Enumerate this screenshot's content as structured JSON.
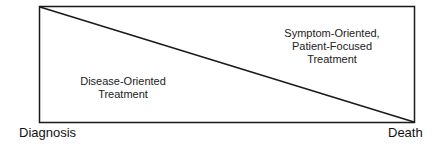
{
  "diagram": {
    "type": "trajectory-box",
    "regions": {
      "lower_left": {
        "line1": "Disease-Oriented",
        "line2": "Treatment"
      },
      "upper_right": {
        "line1": "Symptom-Oriented,",
        "line2": "Patient-Focused",
        "line3": "Treatment"
      }
    },
    "axis": {
      "start": "Diagnosis",
      "end": "Death"
    },
    "colors": {
      "stroke": "#1a1a1a",
      "background": "#ffffff"
    }
  }
}
